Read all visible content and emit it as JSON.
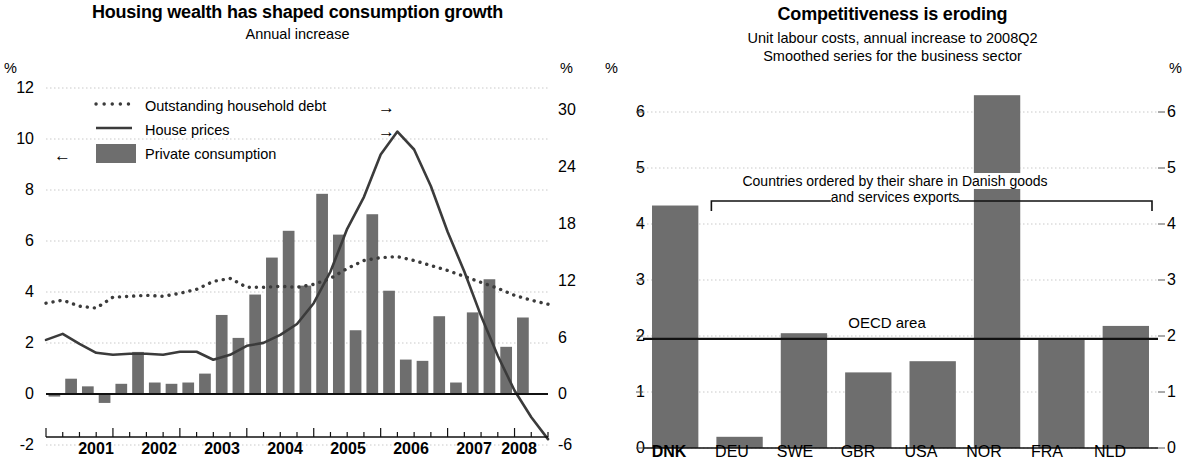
{
  "left": {
    "title": "Housing wealth has shaped consumption growth",
    "subtitle": "Annual increase",
    "unit_left": "%",
    "unit_right": "%",
    "legend": [
      {
        "label": "Outstanding household debt",
        "marker": "dotted",
        "arrow": "→"
      },
      {
        "label": "House prices",
        "marker": "line",
        "arrow": "→"
      },
      {
        "label": "Private consumption",
        "marker": "bar",
        "arrow": "←"
      }
    ],
    "bar_color": "#6e6e6e",
    "line_color": "#3b3b3b"
  },
  "right": {
    "title": "Competitiveness is eroding",
    "subtitle_line1": "Unit labour costs, annual increase to 2008Q2",
    "subtitle_line2": "Smoothed series for the business sector",
    "unit_left": "%",
    "unit_right": "%",
    "annotation_line1": "Countries ordered by their share in Danish goods",
    "annotation_line2": "and services exports",
    "oecd_label": "OECD area",
    "bar_color": "#6e6e6e"
  },
  "chart_data": [
    {
      "type": "bar",
      "id": "housing-wealth",
      "title": "Housing wealth has shaped consumption growth",
      "subtitle": "Annual increase",
      "xlabel": "",
      "ylabel": "%",
      "ylabel_right": "%",
      "ylim": [
        -2,
        12
      ],
      "ylim_right": [
        -6,
        30
      ],
      "yticks": [
        -2,
        0,
        2,
        4,
        6,
        8,
        10,
        12
      ],
      "yticks_right": [
        -6,
        0,
        6,
        12,
        18,
        24,
        30
      ],
      "grid": true,
      "legend_position": "upper-left",
      "categories": [
        "2001Q1",
        "2001Q2",
        "2001Q3",
        "2001Q4",
        "2002Q1",
        "2002Q2",
        "2002Q3",
        "2002Q4",
        "2003Q1",
        "2003Q2",
        "2003Q3",
        "2003Q4",
        "2004Q1",
        "2004Q2",
        "2004Q3",
        "2004Q4",
        "2005Q1",
        "2005Q2",
        "2005Q3",
        "2005Q4",
        "2006Q1",
        "2006Q2",
        "2006Q3",
        "2006Q4",
        "2007Q1",
        "2007Q2",
        "2007Q3",
        "2007Q4",
        "2008Q1",
        "2008Q2"
      ],
      "xtick_labels": [
        "2001",
        "2002",
        "2003",
        "2004",
        "2005",
        "2006",
        "2007",
        "2008"
      ],
      "series": [
        {
          "name": "Private consumption",
          "axis": "left",
          "style": "bar",
          "values": [
            -0.1,
            0.6,
            0.3,
            -0.35,
            0.4,
            1.65,
            0.45,
            0.4,
            0.45,
            0.8,
            3.1,
            2.2,
            3.9,
            5.35,
            6.4,
            4.25,
            7.85,
            6.25,
            2.5,
            7.05,
            4.05,
            1.35,
            1.3,
            3.05,
            0.45,
            3.2,
            4.5,
            1.85,
            3.0
          ]
        },
        {
          "name": "House prices",
          "axis": "right",
          "style": "solid-line",
          "values": [
            4.6,
            5.2,
            4.2,
            3.3,
            3.1,
            3.2,
            3.2,
            3.1,
            3.4,
            3.4,
            2.6,
            3.1,
            4.0,
            4.3,
            5.1,
            6.2,
            8.3,
            11.5,
            15.8,
            19.0,
            23.3,
            25.6,
            23.8,
            20.1,
            15.5,
            11.5,
            7.0,
            3.0,
            -0.5,
            -3.2,
            -5.4
          ]
        },
        {
          "name": "Outstanding household debt",
          "axis": "right",
          "style": "dotted-line",
          "values": [
            8.3,
            8.6,
            8.0,
            7.8,
            8.9,
            9.0,
            9.1,
            9.0,
            9.3,
            9.7,
            10.5,
            10.8,
            9.9,
            9.9,
            10.0,
            9.9,
            10.2,
            10.8,
            11.8,
            12.6,
            12.9,
            13.0,
            12.6,
            12.1,
            11.6,
            11.0,
            10.4,
            9.8,
            9.1,
            8.6,
            8.2
          ]
        }
      ]
    },
    {
      "type": "bar",
      "id": "competitiveness",
      "title": "Competitiveness is eroding",
      "subtitle": "Unit labour costs, annual increase to 2008Q2 / Smoothed series for the business sector",
      "xlabel": "",
      "ylabel": "%",
      "ylabel_right": "%",
      "ylim": [
        0,
        6.6
      ],
      "yticks": [
        0,
        1,
        2,
        3,
        4,
        5,
        6
      ],
      "grid": true,
      "categories": [
        "DNK",
        "DEU",
        "SWE",
        "GBR",
        "USA",
        "NOR",
        "FRA",
        "NLD"
      ],
      "values": [
        4.33,
        0.2,
        2.05,
        1.35,
        1.55,
        6.3,
        1.95,
        2.18
      ],
      "reference_lines": [
        {
          "label": "OECD area",
          "value": 1.95
        }
      ],
      "annotations": [
        {
          "text": "Countries ordered by their share in Danish goods and services exports",
          "covers": [
            "DEU",
            "NLD"
          ]
        }
      ]
    }
  ]
}
